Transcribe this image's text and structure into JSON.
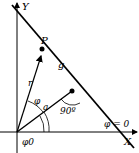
{
  "diagram": {
    "labels": {
      "y_axis": "Y",
      "x_axis": "X",
      "point": "P",
      "line": "g",
      "radius": "r",
      "distance": "a",
      "angle_phi": "φ",
      "angle_alpha": "α",
      "angle_phi0": "φ0",
      "right_angle": "90º",
      "phi_zero": "φ = 0"
    },
    "colors": {
      "stroke": "#000000",
      "background": "#ffffff"
    }
  }
}
